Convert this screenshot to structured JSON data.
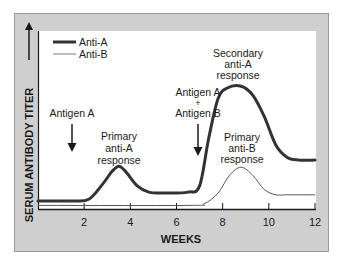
{
  "chart_data": {
    "type": "line",
    "title": "",
    "xlabel": "WEEKS",
    "ylabel": "SERUM ANTIBODY TITER",
    "ylabel_arrow": "up-arrow",
    "xlim": [
      0,
      12
    ],
    "ylim": [
      0,
      100
    ],
    "x_ticks": [
      2,
      4,
      6,
      8,
      10,
      12
    ],
    "x_tick_labels": [
      "2",
      "4",
      "6",
      "8",
      "10",
      "12"
    ],
    "grid": false,
    "legend_position": "top-left",
    "series": [
      {
        "name": "Anti-A",
        "style": "thick",
        "color": "#333333",
        "x": [
          0,
          1.5,
          2.2,
          2.8,
          3.2,
          3.5,
          3.8,
          4.3,
          4.8,
          5.5,
          6.5,
          7.0,
          7.4,
          7.8,
          8.2,
          8.8,
          9.3,
          9.8,
          10.3,
          10.8,
          11.3,
          12
        ],
        "values": [
          4.5,
          4.5,
          5.5,
          14,
          21,
          24,
          21,
          13,
          9.5,
          9,
          9.5,
          13,
          40,
          62,
          68,
          69,
          64,
          52,
          36,
          29,
          27.5,
          27.5
        ]
      },
      {
        "name": "Anti-B",
        "style": "thin",
        "color": "#555555",
        "x": [
          0,
          6.5,
          7.2,
          7.8,
          8.3,
          8.8,
          9.3,
          9.8,
          10.3,
          10.8,
          12
        ],
        "values": [
          2,
          2,
          3,
          9,
          19,
          23.5,
          19,
          11,
          8,
          8,
          8
        ]
      }
    ],
    "annotations": [
      {
        "id": "antigen-a",
        "lines": [
          "Antigen A"
        ],
        "x": 1.5,
        "arrow": "down-arrow"
      },
      {
        "id": "primary-anti-a",
        "lines": [
          "Primary",
          "anti-A",
          "response"
        ],
        "x": 3.5
      },
      {
        "id": "antigen-a-b",
        "lines": [
          "Antigen A",
          "+",
          "Antigen B"
        ],
        "x": 7.0,
        "arrow": "down-arrow"
      },
      {
        "id": "secondary-anti-a",
        "lines": [
          "Secondary",
          "anti-A",
          "response"
        ],
        "x": 8.7
      },
      {
        "id": "primary-anti-b",
        "lines": [
          "Primary",
          "anti-B",
          "response"
        ],
        "x": 8.8
      }
    ]
  },
  "legend": [
    {
      "label": "Anti-A",
      "style": "thick"
    },
    {
      "label": "Anti-B",
      "style": "thin"
    }
  ],
  "colors": {
    "frame": "#cfcfcf",
    "frame_border": "#9a9a9a",
    "plot_bg": "#ffffff",
    "ink": "#1a1a1a",
    "anti_a": "#333333",
    "anti_b": "#555555"
  }
}
